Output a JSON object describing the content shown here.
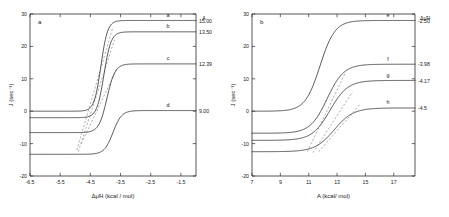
{
  "figure": {
    "panel_a_letter": "a",
    "panel_b_letter": "b"
  },
  "chart_data": [
    {
      "type": "line",
      "panel": "a",
      "title": "",
      "xlabel": "Δμ̃H (kcal / mol)",
      "ylabel": "J (sec⁻¹)",
      "xlim": [
        -6.5,
        -1.0
      ],
      "ylim": [
        -20,
        30
      ],
      "xticks": [
        -6.5,
        -5.5,
        -4.5,
        -3.5,
        -2.5,
        -1.5
      ],
      "xticklabels": [
        "-6.5",
        "-5.5",
        "-4.5",
        "-3.5",
        "-2.5",
        "-1.5"
      ],
      "yticks": [
        -20,
        -10,
        0,
        10,
        20,
        30
      ],
      "yticklabels": [
        "-20",
        "-10",
        "0",
        "10",
        "20",
        "30"
      ],
      "grid": false,
      "legend_position": "right-inline",
      "legend_column_header": "A",
      "series": [
        {
          "name": "a",
          "value_label": "15.00",
          "plateau_low": 0.0,
          "plateau_high": 28.0,
          "midpoint": -4.15,
          "steepness": 9.0
        },
        {
          "name": "b",
          "value_label": "13.50",
          "plateau_low": -2.0,
          "plateau_high": 24.5,
          "midpoint": -4.05,
          "steepness": 8.5
        },
        {
          "name": "c",
          "value_label": "12.39",
          "plateau_low": -6.6,
          "plateau_high": 14.6,
          "midpoint": -3.95,
          "steepness": 7.5
        },
        {
          "name": "d",
          "value_label": "9.00",
          "plateau_low": -13.3,
          "plateau_high": 0.2,
          "midpoint": -3.75,
          "steepness": 7.0
        }
      ],
      "tangents": [
        {
          "for": "a",
          "x1": -4.95,
          "y1": -12.0,
          "x2": -3.75,
          "y2": 26.0
        },
        {
          "for": "b",
          "x1": -4.9,
          "y1": -12.5,
          "x2": -3.7,
          "y2": 22.0
        },
        {
          "for": "c",
          "x1": -4.8,
          "y1": -10.0,
          "x2": -3.6,
          "y2": 13.5
        }
      ]
    },
    {
      "type": "line",
      "panel": "b",
      "title": "",
      "xlabel": "A (kcal/ mol)",
      "ylabel": "J (sec⁻¹)",
      "xlim": [
        7,
        18.5
      ],
      "ylim": [
        -20,
        30
      ],
      "xticks": [
        7,
        9,
        11,
        13,
        15,
        17
      ],
      "xticklabels": [
        "7",
        "9",
        "11",
        "13",
        "15",
        "17"
      ],
      "yticks": [
        -20,
        -10,
        0,
        10,
        20,
        30
      ],
      "yticklabels": [
        "-20",
        "-10",
        "0",
        "10",
        "20",
        "30"
      ],
      "grid": false,
      "legend_position": "right-inline",
      "legend_column_header_main": "Δμ̃H",
      "legend_column_header_sup": "",
      "series": [
        {
          "name": "e",
          "value_label": "-2.50",
          "plateau_low": 0.0,
          "plateau_high": 28.0,
          "midpoint": 11.8,
          "steepness": 1.9
        },
        {
          "name": "f",
          "value_label": "-3.98",
          "plateau_low": -6.8,
          "plateau_high": 14.5,
          "midpoint": 12.3,
          "steepness": 1.7
        },
        {
          "name": "g",
          "value_label": "-4.17",
          "plateau_low": -9.0,
          "plateau_high": 9.5,
          "midpoint": 12.5,
          "steepness": 1.6
        },
        {
          "name": "h",
          "value_label": "-4.5",
          "plateau_low": -12.5,
          "plateau_high": 1.0,
          "midpoint": 12.8,
          "steepness": 1.5
        }
      ],
      "tangents": [
        {
          "for": "e",
          "x1": 10.9,
          "y1": -12.5,
          "x2": 13.6,
          "y2": 12.0
        },
        {
          "for": "f",
          "x1": 11.3,
          "y1": -12.8,
          "x2": 14.1,
          "y2": 6.0
        },
        {
          "for": "g",
          "x1": 11.7,
          "y1": -12.5,
          "x2": 14.6,
          "y2": 2.0
        }
      ]
    }
  ]
}
